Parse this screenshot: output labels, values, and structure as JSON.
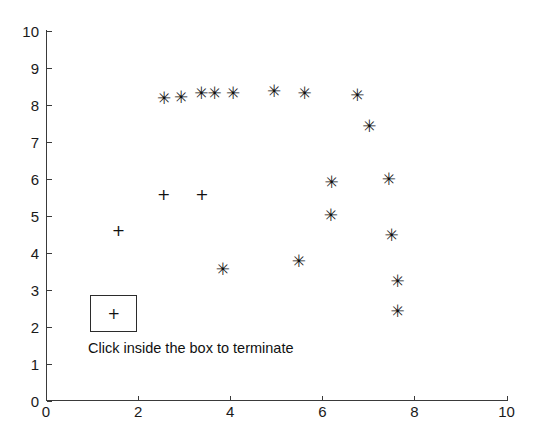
{
  "figure": {
    "background_color": "#ffffff",
    "axis_color": "#3a3a3a",
    "marker_color": "#111111"
  },
  "prompt": {
    "text": "Click inside the box to terminate",
    "box_marker": "+",
    "box_marker_name": "plus-marker"
  },
  "chart_data": {
    "type": "scatter",
    "title": "",
    "xlabel": "",
    "ylabel": "",
    "xlim": [
      0,
      10
    ],
    "ylim": [
      0,
      10
    ],
    "xticks": [
      0,
      2,
      4,
      6,
      8,
      10
    ],
    "xtick_labels": [
      "0",
      "2",
      "4",
      "6",
      "8",
      "10"
    ],
    "yticks": [
      0,
      1,
      2,
      3,
      4,
      5,
      6,
      7,
      8,
      9,
      10
    ],
    "ytick_labels": [
      "0",
      "1",
      "2",
      "3",
      "4",
      "5",
      "6",
      "7",
      "8",
      "9",
      "10"
    ],
    "grid": false,
    "legend": false,
    "box": false,
    "series": [
      {
        "name": "clicked-points-star",
        "marker": "*",
        "marker_glyph": "✳",
        "color": "#111111",
        "points": [
          {
            "x": 2.55,
            "y": 8.16
          },
          {
            "x": 2.92,
            "y": 8.19
          },
          {
            "x": 3.36,
            "y": 8.3
          },
          {
            "x": 3.65,
            "y": 8.3
          },
          {
            "x": 4.05,
            "y": 8.3
          },
          {
            "x": 4.94,
            "y": 8.35
          },
          {
            "x": 5.6,
            "y": 8.3
          },
          {
            "x": 6.75,
            "y": 8.24
          },
          {
            "x": 7.01,
            "y": 7.4
          },
          {
            "x": 7.43,
            "y": 5.96
          },
          {
            "x": 6.17,
            "y": 4.99
          },
          {
            "x": 7.49,
            "y": 4.47
          },
          {
            "x": 7.62,
            "y": 3.22
          },
          {
            "x": 7.62,
            "y": 2.41
          },
          {
            "x": 6.19,
            "y": 5.88
          },
          {
            "x": 5.48,
            "y": 3.77
          },
          {
            "x": 3.83,
            "y": 3.55
          }
        ]
      },
      {
        "name": "clicked-points-plus",
        "marker": "+",
        "marker_glyph": "+",
        "color": "#111111",
        "points": [
          {
            "x": 1.57,
            "y": 4.59
          },
          {
            "x": 2.55,
            "y": 5.56
          },
          {
            "x": 3.38,
            "y": 5.56
          }
        ]
      }
    ],
    "terminate_box": {
      "x_range": [
        0.96,
        1.98
      ],
      "y_range": [
        1.85,
        2.85
      ],
      "center_marker": {
        "x": 1.52,
        "y": 2.33,
        "marker": "+"
      }
    }
  }
}
